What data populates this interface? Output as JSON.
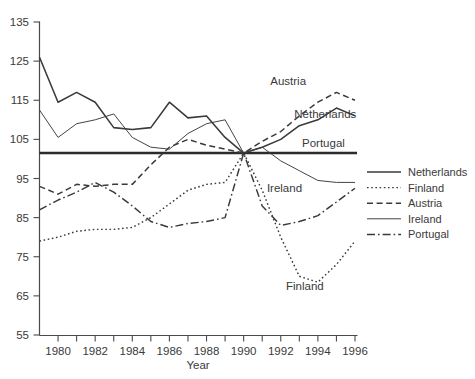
{
  "chart_data": {
    "type": "line",
    "title": "",
    "xlabel": "Year",
    "ylabel": "",
    "xlim": [
      1979,
      1996
    ],
    "ylim": [
      55,
      135
    ],
    "ytick_step": 10,
    "xtick_step": 2,
    "grid": false,
    "legend_position": "right",
    "reference_line": 101.5,
    "x": [
      1979,
      1980,
      1981,
      1982,
      1983,
      1984,
      1985,
      1986,
      1987,
      1988,
      1989,
      1990,
      1991,
      1992,
      1993,
      1994,
      1995,
      1996
    ],
    "series": [
      {
        "name": "Netherlands",
        "style": "solid",
        "values": [
          126.0,
          114.5,
          117.0,
          114.5,
          108.0,
          107.5,
          108.0,
          114.5,
          110.5,
          111.0,
          105.5,
          101.5,
          103.0,
          105.0,
          108.5,
          110.0,
          113.0,
          111.0
        ]
      },
      {
        "name": "Finland",
        "style": "dotted",
        "values": [
          79.0,
          80.0,
          81.5,
          82.0,
          82.0,
          82.5,
          85.0,
          88.5,
          92.0,
          93.5,
          94.0,
          101.5,
          92.0,
          80.0,
          70.0,
          68.5,
          73.0,
          79.0
        ]
      },
      {
        "name": "Austria",
        "style": "dashed",
        "values": [
          93.0,
          91.0,
          93.5,
          93.0,
          93.5,
          93.5,
          98.5,
          103.0,
          105.0,
          103.5,
          102.5,
          101.5,
          104.5,
          107.0,
          111.0,
          114.5,
          117.0,
          115.0
        ]
      },
      {
        "name": "Ireland",
        "style": "solid-thin",
        "values": [
          112.5,
          105.5,
          109.0,
          110.0,
          111.5,
          105.5,
          103.0,
          102.5,
          106.5,
          109.0,
          110.0,
          101.5,
          103.0,
          99.5,
          97.0,
          94.5,
          94.0,
          94.0
        ]
      },
      {
        "name": "Portugal",
        "style": "dash-dot",
        "values": [
          87.0,
          89.5,
          91.5,
          94.0,
          91.5,
          88.0,
          84.0,
          82.5,
          83.5,
          84.0,
          85.0,
          101.5,
          88.0,
          83.0,
          84.0,
          85.5,
          89.0,
          92.5
        ]
      }
    ],
    "inline_labels": [
      {
        "text": "Austria",
        "x": 1992.4,
        "y": 120.0
      },
      {
        "text": "Netherlands",
        "x": 1994.4,
        "y": 111.5
      },
      {
        "text": "Portugal",
        "x": 1994.3,
        "y": 104.0
      },
      {
        "text": "Ireland",
        "x": 1992.2,
        "y": 92.5
      },
      {
        "text": "Finland",
        "x": 1993.3,
        "y": 67.5
      }
    ],
    "ytick_labels": [
      "135",
      "125",
      "115",
      "105",
      "95",
      "85",
      "75",
      "65",
      "55"
    ],
    "xtick_labels": [
      "1980",
      "1982",
      "1984",
      "1986",
      "1988",
      "1990",
      "1992",
      "1994",
      "1996"
    ]
  },
  "legend": {
    "items": [
      {
        "label": "Netherlands",
        "style": "solid"
      },
      {
        "label": "Finland",
        "style": "dotted"
      },
      {
        "label": "Austria",
        "style": "dashed"
      },
      {
        "label": "Ireland",
        "style": "solid-thin"
      },
      {
        "label": "Portugal",
        "style": "dash-dot"
      }
    ]
  },
  "colors": {
    "line": "#3a3a3a",
    "axis": "#4a4a4a",
    "reference": "#2b2b2b",
    "background": "#ffffff"
  }
}
